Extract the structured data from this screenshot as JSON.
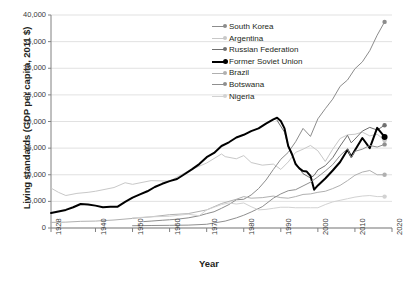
{
  "chart_data": {
    "type": "line",
    "title": "",
    "xlabel": "Year",
    "ylabel": "Living standards (GDP per capita, 2011 $)",
    "xlim": [
      1928,
      2020
    ],
    "ylim": [
      0,
      40000
    ],
    "xticks": [
      "1928",
      "1940",
      "1950",
      "1960",
      "1970",
      "1980",
      "1990",
      "2000",
      "2010",
      "2020"
    ],
    "xtick_values": [
      1928,
      1940,
      1950,
      1960,
      1970,
      1980,
      1990,
      2000,
      2010,
      2020
    ],
    "yticks": [
      "0",
      "5,000",
      "10,000",
      "15,000",
      "20,000",
      "25,000",
      "30,000",
      "35,000",
      "40,000"
    ],
    "ytick_values": [
      0,
      5000,
      10000,
      15000,
      20000,
      25000,
      30000,
      35000,
      40000
    ],
    "grid": "horizontal",
    "legend_position": "top-center",
    "endpoint_markers": true,
    "series": [
      {
        "name": "South Korea",
        "color": "#8c8c8c",
        "width": 1.0,
        "marker": true,
        "x": [
          1953,
          1955,
          1958,
          1960,
          1962,
          1965,
          1968,
          1970,
          1972,
          1974,
          1976,
          1978,
          1980,
          1982,
          1984,
          1986,
          1988,
          1990,
          1992,
          1994,
          1996,
          1998,
          2000,
          2002,
          2004,
          2006,
          2008,
          2010,
          2012,
          2014,
          2016,
          2018
        ],
        "values": [
          1200,
          1300,
          1450,
          1550,
          1650,
          1900,
          2300,
          2700,
          3050,
          3700,
          4400,
          5300,
          5400,
          6200,
          7400,
          9000,
          11000,
          12900,
          14200,
          16200,
          18700,
          17200,
          20500,
          22400,
          24200,
          26600,
          27800,
          29900,
          31200,
          33300,
          36200,
          38700
        ]
      },
      {
        "name": "Argentina",
        "color": "#c8c8c8",
        "width": 1.0,
        "marker": true,
        "x": [
          1928,
          1930,
          1932,
          1935,
          1938,
          1940,
          1945,
          1948,
          1950,
          1955,
          1960,
          1965,
          1970,
          1974,
          1975,
          1978,
          1980,
          1982,
          1985,
          1988,
          1990,
          1992,
          1994,
          1996,
          1998,
          2000,
          2002,
          2004,
          2006,
          2008,
          2010,
          2012,
          2014,
          2016,
          2018
        ],
        "values": [
          7500,
          6700,
          6100,
          6500,
          6700,
          6900,
          7600,
          8500,
          8200,
          8900,
          8800,
          10700,
          12200,
          13900,
          13400,
          13000,
          13600,
          12300,
          11800,
          12000,
          11000,
          12400,
          14200,
          14800,
          15500,
          14500,
          12500,
          14800,
          16800,
          17500,
          17600,
          18000,
          17300,
          17600,
          16500
        ]
      },
      {
        "name": "Russian Federation",
        "color": "#707070",
        "width": 1.0,
        "marker": true,
        "x": [
          1989,
          1991,
          1992,
          1994,
          1996,
          1998,
          1999,
          2000,
          2002,
          2004,
          2006,
          2008,
          2009,
          2010,
          2012,
          2014,
          2016,
          2018
        ],
        "values": [
          20200,
          18000,
          15300,
          12200,
          10200,
          9400,
          9900,
          10900,
          11700,
          13200,
          15400,
          17400,
          16000,
          16700,
          18200,
          18900,
          18400,
          19300
        ]
      },
      {
        "name": "Former Soviet Union",
        "color": "#000000",
        "width": 2.0,
        "marker": true,
        "x": [
          1928,
          1930,
          1932,
          1934,
          1936,
          1938,
          1940,
          1942,
          1944,
          1946,
          1948,
          1950,
          1952,
          1954,
          1956,
          1958,
          1960,
          1962,
          1964,
          1966,
          1968,
          1970,
          1972,
          1974,
          1976,
          1978,
          1980,
          1982,
          1984,
          1986,
          1988,
          1989,
          1990,
          1991,
          1992,
          1993,
          1994,
          1995,
          1996,
          1997,
          1998,
          1999,
          2000,
          2002,
          2004,
          2006,
          2008,
          2009,
          2010,
          2012,
          2014,
          2016,
          2018
        ],
        "values": [
          2800,
          3100,
          3400,
          3900,
          4500,
          4400,
          4200,
          3900,
          4000,
          4000,
          4900,
          5700,
          6300,
          6900,
          7700,
          8300,
          8800,
          9200,
          10100,
          11000,
          12000,
          13300,
          14100,
          15400,
          16100,
          17000,
          17500,
          18200,
          18700,
          19600,
          20400,
          20700,
          20100,
          18700,
          15400,
          13900,
          12000,
          11200,
          10700,
          10600,
          9800,
          7200,
          8000,
          9300,
          10800,
          12400,
          14700,
          13400,
          14600,
          16900,
          15000,
          18800,
          17100
        ]
      },
      {
        "name": "Brazil",
        "color": "#b0b0b0",
        "width": 1.0,
        "marker": true,
        "x": [
          1928,
          1932,
          1936,
          1940,
          1945,
          1950,
          1955,
          1960,
          1965,
          1970,
          1974,
          1978,
          1980,
          1982,
          1985,
          1988,
          1990,
          1992,
          1994,
          1996,
          1998,
          2000,
          2002,
          2004,
          2006,
          2008,
          2010,
          2012,
          2014,
          2016,
          2018
        ],
        "values": [
          1050,
          1100,
          1250,
          1300,
          1500,
          1800,
          2100,
          2500,
          2700,
          3400,
          4600,
          5400,
          5900,
          5600,
          5700,
          6000,
          5700,
          5600,
          5900,
          6300,
          6400,
          6700,
          6900,
          7400,
          8000,
          8900,
          9900,
          10500,
          10800,
          10000,
          10000
        ]
      },
      {
        "name": "Botswana",
        "color": "#8f8f8f",
        "width": 1.0,
        "marker": true,
        "x": [
          1950,
          1955,
          1960,
          1965,
          1970,
          1972,
          1975,
          1978,
          1980,
          1982,
          1985,
          1988,
          1990,
          1992,
          1994,
          1996,
          1998,
          2000,
          2002,
          2004,
          2006,
          2008,
          2009,
          2010,
          2012,
          2014,
          2016,
          2018
        ],
        "values": [
          430,
          470,
          500,
          540,
          700,
          950,
          1300,
          1900,
          2400,
          3000,
          4000,
          5600,
          6400,
          7000,
          7200,
          7900,
          8600,
          9600,
          10700,
          11900,
          13600,
          14900,
          13200,
          14400,
          14800,
          15500,
          15200,
          15700
        ]
      },
      {
        "name": "Nigeria",
        "color": "#d2d2d2",
        "width": 1.0,
        "marker": true,
        "x": [
          1950,
          1955,
          1960,
          1965,
          1968,
          1970,
          1972,
          1974,
          1976,
          1978,
          1980,
          1982,
          1984,
          1986,
          1988,
          1990,
          1992,
          1994,
          1996,
          1998,
          2000,
          2002,
          2004,
          2006,
          2008,
          2010,
          2012,
          2014,
          2016,
          2018
        ],
        "values": [
          1900,
          2100,
          2200,
          2600,
          2300,
          3400,
          3900,
          4400,
          4700,
          4500,
          4700,
          4000,
          3400,
          3500,
          3700,
          3900,
          3900,
          3800,
          3800,
          3800,
          3800,
          4400,
          4900,
          5200,
          5500,
          5800,
          6000,
          6100,
          5900,
          5900
        ]
      }
    ]
  },
  "legend": {
    "items": [
      {
        "label": "South Korea"
      },
      {
        "label": "Argentina"
      },
      {
        "label": "Russian Federation"
      },
      {
        "label": "Former Soviet Union"
      },
      {
        "label": "Brazil"
      },
      {
        "label": "Botswana"
      },
      {
        "label": "Nigeria"
      }
    ]
  },
  "colors": {
    "grid": "#d9d9d9",
    "axis": "#808080",
    "text": "#231f20",
    "background": "#ffffff"
  }
}
